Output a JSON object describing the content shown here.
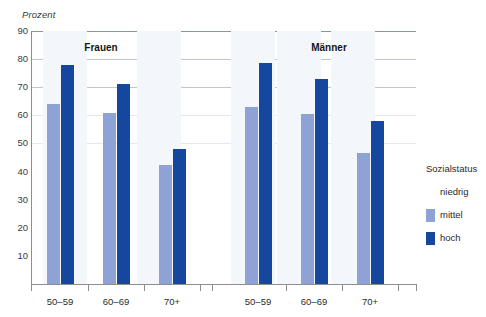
{
  "top_clipped_caption": "",
  "unit_label": "Prozent",
  "legend": {
    "title": "Sozialstatus",
    "items": [
      {
        "label": "niedrig",
        "color": ""
      },
      {
        "label": "mittel",
        "color": "#8fa2d6"
      },
      {
        "label": "hoch",
        "color": "#16479f"
      }
    ]
  },
  "chart_data": {
    "type": "bar",
    "title": "",
    "subtitle": "",
    "xlabel": "",
    "ylabel": "Prozent",
    "ylim": [
      0,
      90
    ],
    "ytick_labels": [
      "90",
      "80",
      "70",
      "60",
      "50",
      "40",
      "30",
      "20",
      "10"
    ],
    "ytick_values": [
      90,
      80,
      70,
      60,
      50,
      40,
      30,
      20,
      10
    ],
    "ytick_step": 10,
    "grid": "horizontal",
    "legend_position": "right",
    "panels": [
      {
        "name": "Frauen",
        "categories": [
          "50–59",
          "60–69",
          "70+"
        ],
        "series": [
          {
            "name": "niedrig",
            "color": "",
            "values": [
              null,
              null,
              null
            ]
          },
          {
            "name": "mittel",
            "color": "#8fa2d6",
            "values": [
              64.0,
              61.0,
              42.5
            ]
          },
          {
            "name": "hoch",
            "color": "#16479f",
            "values": [
              78.0,
              71.0,
              48.0
            ]
          }
        ]
      },
      {
        "name": "Männer",
        "categories": [
          "50–59",
          "60–69",
          "70+"
        ],
        "series": [
          {
            "name": "niedrig",
            "color": "",
            "values": [
              null,
              null,
              null
            ]
          },
          {
            "name": "mittel",
            "color": "#8fa2d6",
            "values": [
              63.0,
              60.5,
              46.5
            ]
          },
          {
            "name": "hoch",
            "color": "#16479f",
            "values": [
              78.5,
              73.0,
              58.0
            ]
          }
        ]
      }
    ],
    "colors": {
      "mittel": "#8fa2d6",
      "hoch": "#16479f",
      "gridline": "#b9c6e2",
      "axis": "#8e8e92"
    }
  }
}
